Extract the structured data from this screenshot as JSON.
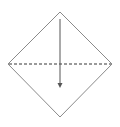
{
  "figure": {
    "title": "Rhombus with vertical arrow and dashed horizontal diagonal",
    "type": "geometric-diagram",
    "canvas": {
      "width": 120,
      "height": 127,
      "background_color": "#ffffff"
    },
    "colors": {
      "outline": "#8a8a8a",
      "dashed_diagonal": "#9a9a9a",
      "arrow": "#555555",
      "background": "#ffffff"
    },
    "shape": {
      "name": "rhombus",
      "label": "Rhombus outline",
      "stroke_color": "#8a8a8a",
      "stroke_width": 1,
      "fill": "none",
      "vertices": [
        {
          "name": "top-vertex",
          "x": 60,
          "y": 12
        },
        {
          "name": "right-vertex",
          "x": 112,
          "y": 64
        },
        {
          "name": "bottom-vertex",
          "x": 60,
          "y": 117
        },
        {
          "name": "left-vertex",
          "x": 8,
          "y": 64
        }
      ],
      "points_attr": "60,12 112,64 60,117 8,64"
    },
    "dashed_diagonal": {
      "name": "horizontal-diagonal",
      "label": "Horizontal dashed diagonal",
      "x1": 9,
      "y1": 64,
      "x2": 111,
      "y2": 64,
      "stroke_color": "#9a9a9a",
      "stroke_width": 2,
      "dash_pattern": "3 2"
    },
    "arrow": {
      "name": "vertical-arrow",
      "label": "Vertical downward arrow",
      "x1": 60,
      "y1": 19,
      "x2": 60,
      "y2": 84,
      "stroke_color": "#555555",
      "stroke_width": 1,
      "head": {
        "points_attr": "57.5,83 62.5,83 60,88",
        "fill": "#555555",
        "width": 5,
        "height": 5
      }
    }
  }
}
